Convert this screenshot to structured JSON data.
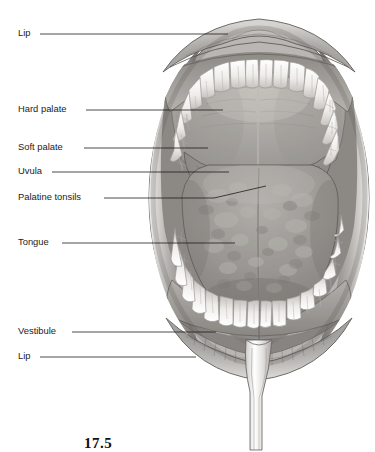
{
  "figure": {
    "caption": "17.5",
    "background_color": "#ffffff",
    "line_color": "#1c1c1c"
  },
  "labels": [
    {
      "id": "lip-upper",
      "text": "Lip",
      "x": 18,
      "y": 34,
      "leader_end_x": 228,
      "leader_end_y": 34
    },
    {
      "id": "hard-palate",
      "text": "Hard palate",
      "x": 18,
      "y": 110,
      "leader_end_x": 223,
      "leader_end_y": 110
    },
    {
      "id": "soft-palate",
      "text": "Soft palate",
      "x": 18,
      "y": 148,
      "leader_end_x": 208,
      "leader_end_y": 148
    },
    {
      "id": "uvula",
      "text": "Uvula",
      "x": 18,
      "y": 172,
      "leader_end_x": 229,
      "leader_end_y": 172
    },
    {
      "id": "palatine-tonsils",
      "text": "Palatine tonsils",
      "x": 18,
      "y": 198,
      "leader_end_x": 266,
      "leader_end_y": 186
    },
    {
      "id": "tongue",
      "text": "Tongue",
      "x": 18,
      "y": 243,
      "leader_end_x": 235,
      "leader_end_y": 243
    },
    {
      "id": "vestibule",
      "text": "Vestibule",
      "x": 18,
      "y": 332,
      "leader_end_x": 216,
      "leader_end_y": 332
    },
    {
      "id": "lip-lower",
      "text": "Lip",
      "x": 18,
      "y": 357,
      "leader_end_x": 196,
      "leader_end_y": 357
    }
  ],
  "anatomy": {
    "structures": [
      "upper lip",
      "lower lip",
      "upper dental arch",
      "lower dental arch",
      "hard palate",
      "soft palate",
      "uvula",
      "palatine tonsils",
      "tongue",
      "oral vestibule",
      "oropharynx",
      "lingual frenulum retractor"
    ],
    "colors": {
      "teeth": "#f2f0ec",
      "teeth_shadow": "#b9b7b2",
      "lip_light": "#c8c6c3",
      "lip_mid": "#8e8c89",
      "lip_dark": "#5a5855",
      "palate_light": "#aeaba7",
      "palate_mid": "#97948f",
      "tongue": "#9c9995",
      "tongue_dark": "#7d7a76",
      "pharynx_dark": "#2e2c2a",
      "gum": "#86837f",
      "outline": "#4a4845"
    }
  }
}
